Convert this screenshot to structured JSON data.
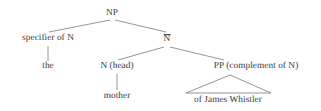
{
  "figure": {
    "type": "syntax-tree",
    "background_color": "#ffffff",
    "text_color": "#38383c",
    "line_color": "#8a8a90"
  },
  "nodes": {
    "np": {
      "label": "NP",
      "x": 112,
      "y": 14
    },
    "specifier": {
      "label": "specifier of N",
      "x": 48,
      "y": 39
    },
    "nbar_text": {
      "label": "N",
      "x": 167,
      "y": 40
    },
    "the": {
      "label": "the",
      "x": 48,
      "y": 67
    },
    "n_head": {
      "label": "N (head)",
      "x": 117,
      "y": 67
    },
    "pp": {
      "label": "PP (complement of N)",
      "x": 256,
      "y": 67
    },
    "mother": {
      "label": "mother",
      "x": 117,
      "y": 97
    },
    "phrase": {
      "label": "of James Whistler",
      "x": 228,
      "y": 101
    }
  },
  "edges": [
    {
      "name": "np-to-specifier",
      "x1": 110,
      "y1": 20,
      "x2": 49,
      "y2": 32
    },
    {
      "name": "np-to-nbar",
      "x1": 115,
      "y1": 20,
      "x2": 166,
      "y2": 32
    },
    {
      "name": "specifier-to-the",
      "x1": 48,
      "y1": 46,
      "x2": 48,
      "y2": 61
    },
    {
      "name": "nbar-to-nhead",
      "x1": 164,
      "y1": 47,
      "x2": 118,
      "y2": 60
    },
    {
      "name": "nbar-to-pp",
      "x1": 170,
      "y1": 47,
      "x2": 224,
      "y2": 60
    },
    {
      "name": "nhead-to-mother",
      "x1": 117,
      "y1": 74,
      "x2": 117,
      "y2": 90
    }
  ],
  "triangle": {
    "name": "pp-expansion-triangle",
    "apex_x": 230,
    "apex_y": 75,
    "left_x": 186,
    "right_x": 271,
    "base_y": 93
  }
}
